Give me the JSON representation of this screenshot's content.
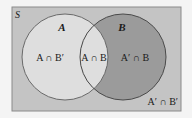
{
  "diagram": {
    "type": "venn",
    "universe": {
      "label": "S"
    },
    "sets": [
      {
        "name": "A",
        "label": "A"
      },
      {
        "name": "B",
        "label": "B"
      }
    ],
    "regions": {
      "a_only": "A ∩ B′",
      "a_and_b": "A ∩ B",
      "b_only": "A′ ∩ B",
      "neither": "A′ ∩ B′"
    },
    "colors": {
      "page": "#f4f4f4",
      "universe_fill": "#c4c4c4",
      "set_a_fill": "#dedede",
      "set_b_fill": "#9b9b9b",
      "outline": "#5a5a5a"
    }
  }
}
